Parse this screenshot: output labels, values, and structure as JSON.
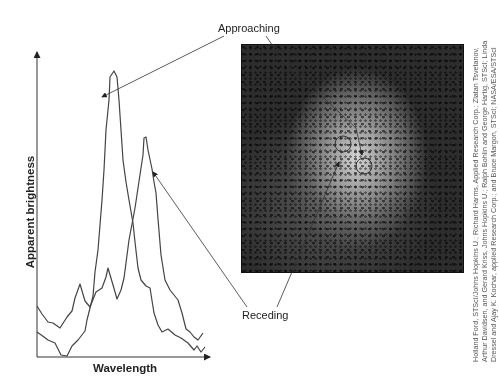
{
  "figure": {
    "type": "spectrum-and-image-diagram",
    "labels": {
      "approaching": "Approaching",
      "receding": "Receding",
      "x_axis": "Wavelength",
      "y_axis": "Apparent brightness"
    },
    "credit": "Holland Ford, STScI/Johns Hopkins U.; Richard Harms, Applied Research Corp.; Zlatan Tsvetanov, Arthur Davidsen, and Gerard Kriss, Johns Hopkins U.; Ralph Bohlin and George Hartig, STScI; Linda Dressel and Ajay K. Kochar, applied Research Corp.; and Bruce Margon, STScI; NASA/ESA/STScI",
    "image": {
      "description": "Grayscale telescope image of galaxy core with two circled regions",
      "circles": [
        {
          "name": "receding-region",
          "cx": 343,
          "cy": 144,
          "r": 8
        },
        {
          "name": "approaching-region",
          "cx": 364,
          "cy": 166,
          "r": 8
        }
      ]
    }
  },
  "chart_data": {
    "type": "line",
    "title": "",
    "xlabel": "Wavelength",
    "ylabel": "Apparent brightness",
    "grid": false,
    "ticks": "none",
    "series": [
      {
        "name": "Approaching (blueshifted) spectrum",
        "peak_x_rel": 0.34,
        "peak_height_rel": 0.88,
        "points_px": [
          [
            37,
            332
          ],
          [
            44,
            337
          ],
          [
            48,
            340
          ],
          [
            55,
            343
          ],
          [
            61,
            355
          ],
          [
            67,
            356
          ],
          [
            72,
            346
          ],
          [
            78,
            340
          ],
          [
            85,
            331
          ],
          [
            87,
            320
          ],
          [
            93,
            296
          ],
          [
            95,
            272
          ],
          [
            98,
            250
          ],
          [
            100,
            225
          ],
          [
            102,
            200
          ],
          [
            104,
            170
          ],
          [
            106,
            130
          ],
          [
            109,
            100
          ],
          [
            110,
            77
          ],
          [
            114,
            71
          ],
          [
            117,
            77
          ],
          [
            119,
            100
          ],
          [
            121,
            130
          ],
          [
            123,
            160
          ],
          [
            126,
            182
          ],
          [
            129,
            200
          ],
          [
            133,
            223
          ],
          [
            135,
            242
          ],
          [
            138,
            268
          ],
          [
            141,
            280
          ],
          [
            146,
            286
          ],
          [
            150,
            288
          ],
          [
            154,
            313
          ],
          [
            158,
            325
          ],
          [
            162,
            332
          ],
          [
            168,
            329
          ],
          [
            175,
            335
          ],
          [
            181,
            338
          ],
          [
            188,
            343
          ],
          [
            194,
            350
          ],
          [
            197,
            346
          ],
          [
            201,
            352
          ],
          [
            205,
            347
          ]
        ]
      },
      {
        "name": "Receding (redshifted) spectrum",
        "peak_x_rel": 0.65,
        "peak_height_rel": 0.68,
        "points_px": [
          [
            37,
            306
          ],
          [
            42,
            314
          ],
          [
            48,
            322
          ],
          [
            53,
            323
          ],
          [
            60,
            328
          ],
          [
            67,
            317
          ],
          [
            72,
            311
          ],
          [
            75,
            298
          ],
          [
            80,
            284
          ],
          [
            85,
            301
          ],
          [
            90,
            307
          ],
          [
            96,
            292
          ],
          [
            102,
            288
          ],
          [
            106,
            277
          ],
          [
            108,
            268
          ],
          [
            113,
            285
          ],
          [
            117,
            299
          ],
          [
            121,
            290
          ],
          [
            124,
            278
          ],
          [
            126,
            263
          ],
          [
            129,
            240
          ],
          [
            132,
            224
          ],
          [
            135,
            208
          ],
          [
            138,
            188
          ],
          [
            141,
            168
          ],
          [
            143,
            155
          ],
          [
            144,
            138
          ],
          [
            146,
            137
          ],
          [
            148,
            150
          ],
          [
            152,
            169
          ],
          [
            154,
            182
          ],
          [
            156,
            193
          ],
          [
            158,
            219
          ],
          [
            161,
            255
          ],
          [
            165,
            280
          ],
          [
            170,
            290
          ],
          [
            178,
            300
          ],
          [
            182,
            313
          ],
          [
            186,
            329
          ],
          [
            190,
            332
          ],
          [
            194,
            337
          ],
          [
            198,
            340
          ],
          [
            203,
            333
          ]
        ]
      }
    ],
    "annotations": [
      {
        "text": "Approaching",
        "points_to": "left (taller) peak and circle in image"
      },
      {
        "text": "Receding",
        "points_to": "right (shorter) peak and circle in image"
      }
    ]
  }
}
